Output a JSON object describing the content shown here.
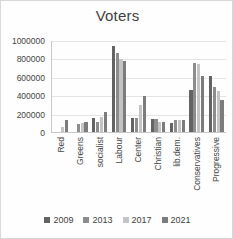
{
  "chart_data": {
    "type": "bar",
    "title": "Voters",
    "xlabel": "",
    "ylabel": "",
    "ylim": [
      0,
      1000000
    ],
    "yticks": [
      0,
      200000,
      400000,
      600000,
      800000,
      1000000
    ],
    "ytick_labels": [
      "0",
      "200000",
      "400000",
      "600000",
      "800000",
      "1000000"
    ],
    "grid": true,
    "legend_position": "bottom",
    "categories": [
      "Red",
      "Greens",
      "socialist",
      "Labour",
      "Center",
      "Christian",
      "lib.dem.",
      "Conservatives",
      "Progressive"
    ],
    "series": [
      {
        "name": "2009",
        "color": "#636363",
        "values": [
          0,
          0,
          165000,
          950000,
          165000,
          155000,
          105000,
          470000,
          620000
        ]
      },
      {
        "name": "2013",
        "color": "#8d8d8d",
        "values": [
          0,
          100000,
          125000,
          875000,
          160000,
          155000,
          140000,
          760000,
          505000
        ]
      },
      {
        "name": "2017",
        "color": "#c4c4c4",
        "values": [
          60000,
          105000,
          175000,
          800000,
          300000,
          125000,
          140000,
          755000,
          455000
        ]
      },
      {
        "name": "2021",
        "color": "#7c7c7c",
        "values": [
          140000,
          115000,
          230000,
          785000,
          400000,
          125000,
          140000,
          615000,
          355000
        ]
      }
    ]
  },
  "legend": {
    "items": [
      {
        "label": "2009",
        "color": "#636363"
      },
      {
        "label": "2013",
        "color": "#8d8d8d"
      },
      {
        "label": "2017",
        "color": "#c4c4c4"
      },
      {
        "label": "2021",
        "color": "#7c7c7c"
      }
    ]
  }
}
